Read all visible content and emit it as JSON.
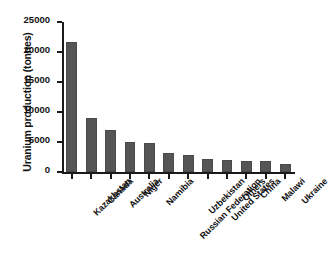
{
  "chart_data": {
    "type": "bar",
    "title": "",
    "xlabel": "",
    "ylabel": "Uranium production (tonnes)",
    "categories": [
      "Kazakhstan",
      "Canada",
      "Australia",
      "Niger",
      "Namibia",
      "Russian Federation",
      "Uzbekistan",
      "United States",
      "Others",
      "China",
      "Malawi",
      "Ukraine"
    ],
    "values": [
      21700,
      9000,
      7000,
      5000,
      4900,
      3200,
      2800,
      2100,
      2000,
      1900,
      1800,
      1400
    ],
    "ylim": [
      0,
      25000
    ],
    "ytick_labels": [
      "0",
      "5000",
      "10000",
      "15000",
      "20000",
      "25000"
    ],
    "ytick_values": [
      0,
      5000,
      10000,
      15000,
      20000,
      25000
    ],
    "grid": false,
    "legend": false,
    "bar_color": "#555555",
    "axis_color": "#1a1a1a",
    "background_color": "#ffffff",
    "xtick_label_rotation": -45
  }
}
